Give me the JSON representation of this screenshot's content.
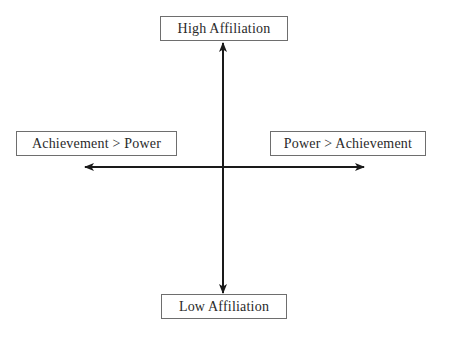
{
  "diagram": {
    "type": "quadrant-axes",
    "axes": {
      "vertical": {
        "top_label": "High Affiliation",
        "bottom_label": "Low Affiliation"
      },
      "horizontal": {
        "left_label": "Achievement > Power",
        "right_label": "Power > Achievement"
      }
    },
    "colors": {
      "line": "#1a1a1a",
      "box_border": "#6e6e6e",
      "text": "#2a2a2a",
      "background": "#ffffff"
    },
    "caption": ""
  }
}
